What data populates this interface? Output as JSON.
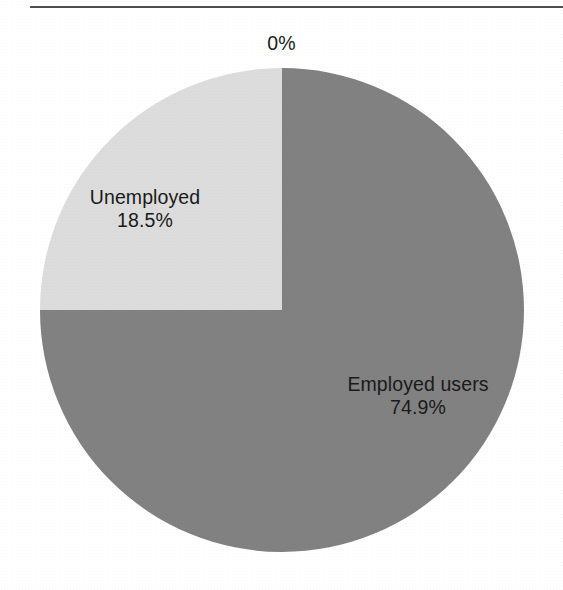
{
  "page": {
    "width": 563,
    "height": 590,
    "background": "#ffffff",
    "rule_color": "#4e4e4e"
  },
  "chart_data": {
    "type": "pie",
    "title": "",
    "subtitle": "",
    "xlabel": "",
    "ylabel": "",
    "grid": false,
    "legend_position": "none",
    "labels_inside_slices": true,
    "center": {
      "x": 282,
      "y": 310
    },
    "radius": 242,
    "start_angle_deg": 0,
    "direction": "clockwise",
    "categories": [
      "Employed users",
      "Unemployed",
      ""
    ],
    "values": [
      74.9,
      18.5,
      0
    ],
    "series": [
      {
        "name": "User employment status",
        "values": [
          74.9,
          18.5,
          0
        ]
      }
    ],
    "slices": [
      {
        "label": "Employed users",
        "value": 74.9,
        "value_text": "74.9%",
        "color": "#818181",
        "sweep_deg": 270,
        "start_deg": 0
      },
      {
        "label": "Unemployed",
        "value": 18.5,
        "value_text": "18.5%",
        "color": "#dcdcdc",
        "sweep_deg": 90,
        "start_deg": 270
      },
      {
        "label": "",
        "value": 0,
        "value_text": "0%",
        "color": "#dcdcdc",
        "sweep_deg": 0,
        "start_deg": 0
      }
    ],
    "annotations": [
      {
        "name": "zero-callout",
        "text": "0%",
        "x": 283,
        "y": 43
      }
    ]
  },
  "labels": {
    "zero": "0%",
    "slice_unemployed": {
      "name": "Unemployed",
      "percent": "18.5%"
    },
    "slice_employed": {
      "name": "Employed users",
      "percent": "74.9%"
    }
  }
}
